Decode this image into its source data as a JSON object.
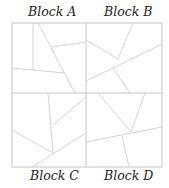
{
  "diagram": {
    "labels": {
      "a": "Block A",
      "b": "Block B",
      "c": "Block C",
      "d": "Block D"
    },
    "line_color": "#cfcfcf",
    "frame_color": "#bdbdbd"
  }
}
